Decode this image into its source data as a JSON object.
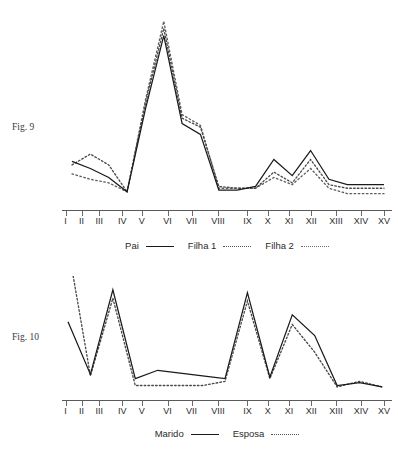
{
  "page": {
    "top_clipped_text": "                                                                     "
  },
  "figures": [
    {
      "id": "fig9",
      "caption": "Fig. 9",
      "legend": [
        {
          "label": "Pai",
          "style": "solid"
        },
        {
          "label": "Filha 1",
          "style": "dotted"
        },
        {
          "label": "Filha 2",
          "style": "dotted"
        }
      ],
      "chart_data": {
        "type": "line",
        "title": "Fig. 9",
        "xlabel": "",
        "ylabel": "",
        "grid": false,
        "legend_position": "bottom",
        "categories": [
          "I",
          "II",
          "III",
          "IV",
          "V",
          "VI",
          "VII",
          "VIII",
          "IX",
          "X",
          "XI",
          "XII",
          "XIII",
          "XIV",
          "XV"
        ],
        "ylim": [
          0,
          100
        ],
        "series": [
          {
            "name": "Pai",
            "style": "solid",
            "values": [
              26,
              22,
              17,
              9,
              55,
              96,
              47,
              41,
              10,
              10,
              12,
              27,
              18,
              32,
              16,
              13,
              13,
              13
            ]
          },
          {
            "name": "Filha 1",
            "style": "dotted",
            "values": [
              24,
              30,
              24,
              9,
              58,
              100,
              50,
              45,
              12,
              11,
              11,
              20,
              14,
              27,
              13,
              11,
              11,
              11
            ]
          },
          {
            "name": "Filha 2",
            "style": "dotted",
            "values": [
              19,
              16,
              14,
              9,
              60,
              104,
              52,
              46,
              11,
              11,
              11,
              17,
              13,
              22,
              11,
              8,
              8,
              8
            ]
          }
        ]
      }
    },
    {
      "id": "fig10",
      "caption": "Fig. 10",
      "legend": [
        {
          "label": "Marido",
          "style": "solid"
        },
        {
          "label": "Esposa",
          "style": "dotted"
        }
      ],
      "chart_data": {
        "type": "line",
        "title": "Fig. 10",
        "xlabel": "",
        "ylabel": "",
        "grid": false,
        "legend_position": "bottom",
        "categories": [
          "I",
          "II",
          "III",
          "IV",
          "V",
          "VI",
          "VII",
          "VIII",
          "IX",
          "X",
          "XI",
          "XII",
          "XIII",
          "XIV",
          "XV"
        ],
        "ylim": [
          0,
          100
        ],
        "series": [
          {
            "name": "Marido",
            "style": "solid",
            "values": [
              55,
              17,
              78,
              14,
              20,
              18,
              16,
              14,
              76,
              15,
              60,
              45,
              9,
              11,
              8
            ]
          },
          {
            "name": "Esposa",
            "style": "dotted",
            "values": [
              112,
              16,
              72,
              9,
              9,
              9,
              9,
              12,
              70,
              14,
              53,
              33,
              8,
              12,
              8
            ]
          }
        ]
      }
    }
  ]
}
